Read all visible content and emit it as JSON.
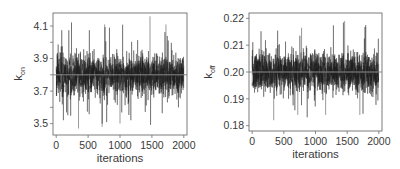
{
  "chart_data": [
    {
      "type": "line",
      "title": "",
      "xlabel": "iterations",
      "ylabel": "k_on",
      "ylabel_main": "k",
      "ylabel_sub": "on",
      "xlim": [
        -50,
        2050
      ],
      "ylim": [
        3.43,
        4.18
      ],
      "xticks": [
        0,
        500,
        1000,
        1500,
        2000
      ],
      "xtick_labels": [
        "0",
        "500",
        "1000",
        "1500",
        "2000"
      ],
      "yticks": [
        3.5,
        3.6,
        3.7,
        3.8,
        3.9,
        4.0,
        4.1
      ],
      "ytick_labels": [
        "3.5",
        "",
        "3.7",
        "",
        "3.9",
        "",
        "4.1"
      ],
      "grid": false,
      "n_iterations": 2000,
      "series": [
        {
          "name": "k_on trace",
          "mean": 3.8,
          "sd": 0.07,
          "min": 3.47,
          "max": 4.16,
          "color": "#1e1e1e"
        }
      ],
      "hline": {
        "y": 3.8,
        "color": "#8a8a8a"
      },
      "frame": {
        "x0": 53,
        "y0": 13,
        "x1": 187,
        "y1": 135
      }
    },
    {
      "type": "line",
      "title": "",
      "xlabel": "iterations",
      "ylabel": "k_off",
      "ylabel_main": "k",
      "ylabel_sub": "off",
      "xlim": [
        -50,
        2050
      ],
      "ylim": [
        0.178,
        0.222
      ],
      "xticks": [
        0,
        500,
        1000,
        1500,
        2000
      ],
      "xtick_labels": [
        "0",
        "500",
        "1000",
        "1500",
        "2000"
      ],
      "yticks": [
        0.18,
        0.19,
        0.2,
        0.21,
        0.22
      ],
      "ytick_labels": [
        "0.18",
        "0.19",
        "0.20",
        "0.21",
        "0.22"
      ],
      "grid": false,
      "n_iterations": 2000,
      "series": [
        {
          "name": "k_off trace",
          "mean": 0.2,
          "sd": 0.0042,
          "min": 0.182,
          "max": 0.219,
          "color": "#1e1e1e"
        }
      ],
      "hline": {
        "y": 0.2,
        "color": "#8a8a8a"
      },
      "frame": {
        "x0": 249,
        "y0": 13,
        "x1": 382,
        "y1": 131
      }
    }
  ]
}
